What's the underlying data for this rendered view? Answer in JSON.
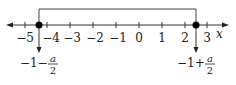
{
  "diagram": {
    "type": "number-line",
    "axis_label": "x",
    "ticks": [
      {
        "value": -5,
        "label": "−5",
        "x": 25
      },
      {
        "value": -4,
        "label": "−4",
        "x": 47
      },
      {
        "value": -3,
        "label": "−3",
        "x": 70
      },
      {
        "value": -2,
        "label": "−2",
        "x": 93
      },
      {
        "value": -1,
        "label": "−1",
        "x": 116
      },
      {
        "value": 0,
        "label": "0",
        "x": 139
      },
      {
        "value": 1,
        "label": "1",
        "x": 162
      },
      {
        "value": 2,
        "label": "2",
        "x": 185
      },
      {
        "value": 3,
        "label": "3",
        "x": 207
      }
    ],
    "points": [
      {
        "name": "left-root",
        "x": 39,
        "approx_value": -4.6,
        "expr_prefix": "−1−",
        "expr_num": "a",
        "expr_den": "2"
      },
      {
        "name": "right-root",
        "x": 196,
        "approx_value": 2.5,
        "expr_prefix": "−1+",
        "expr_num": "a",
        "expr_den": "2"
      }
    ],
    "bracket": {
      "from": "left-root",
      "to": "right-root"
    },
    "colors": {
      "line": "#222222",
      "dot": "#000000"
    }
  }
}
